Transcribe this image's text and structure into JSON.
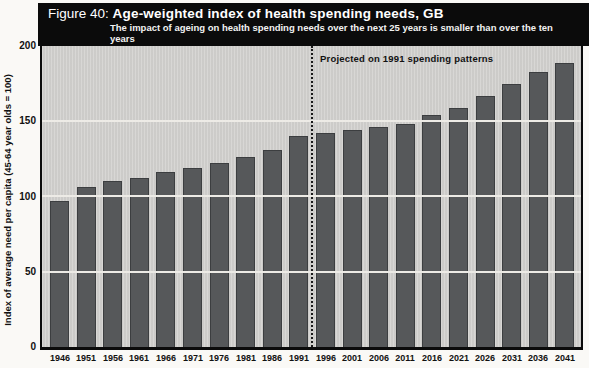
{
  "figure": {
    "label": "Figure 40:",
    "title": "Age-weighted index of health spending needs, GB",
    "subtitle_line1": "The impact of ageing on health spending needs over the next 25 years is smaller than over the ten years",
    "subtitle_line2": "up to 1991."
  },
  "annotation": "Projected on 1991 spending patterns",
  "colors": {
    "header_bg": "#0b0b0b",
    "header_text": "#ffffff",
    "plot_bg": "#d3d2cf",
    "bar": "#56585a",
    "gridline": "#edebe6",
    "axis_line": "#0b0b0b",
    "text": "#111111",
    "page_bg": "#faf9f6"
  },
  "chart_data": {
    "type": "bar",
    "title": "Age-weighted index of health spending needs, GB",
    "subtitle": "The impact of ageing on health spending needs over the next 25 years is smaller than over the ten years up to 1991.",
    "categories": [
      "1946",
      "1951",
      "1956",
      "1961",
      "1966",
      "1971",
      "1976",
      "1981",
      "1986",
      "1991",
      "1996",
      "2001",
      "2006",
      "2011",
      "2016",
      "2021",
      "2026",
      "2031",
      "2036",
      "2041"
    ],
    "values": [
      97,
      106,
      110,
      112,
      116,
      119,
      122,
      126,
      131,
      140,
      142,
      144,
      146,
      148,
      154,
      159,
      167,
      175,
      183,
      189
    ],
    "xlabel": "",
    "ylabel": "Index of average need per capita (45-64 year olds = 100)",
    "ylim": [
      0,
      200
    ],
    "yticks": [
      0,
      50,
      100,
      150,
      200
    ],
    "gridlines": [
      50,
      100,
      150
    ],
    "grid": "horizontal white lines over bars",
    "legend": "none",
    "divider_after_category": "1991",
    "divider_label": "Projected on 1991 spending patterns",
    "bar_color": "#56585a"
  }
}
